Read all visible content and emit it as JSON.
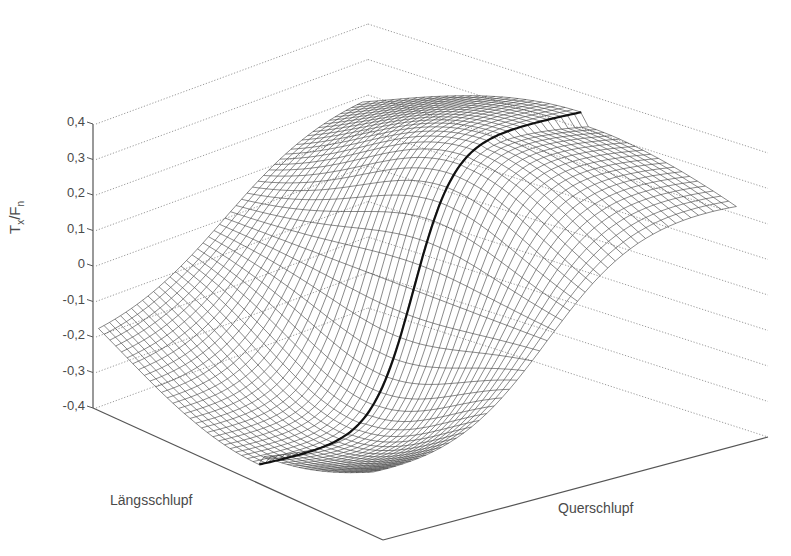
{
  "chart_data": {
    "type": "surface3d",
    "title": "",
    "zlabel": "T_x/F_n",
    "zlabel_main1": "T",
    "zlabel_sub1": "x",
    "zlabel_sep": "/F",
    "zlabel_sub2": "n",
    "xlabel": "Längsschlupf",
    "ylabel": "Querschlupf",
    "zlim": [
      -0.4,
      0.4
    ],
    "z_ticks": [
      0.4,
      0.3,
      0.2,
      0.1,
      0,
      -0.1,
      -0.2,
      -0.3,
      -0.4
    ],
    "z_tick_labels": [
      "0,4",
      "0,3",
      "0,2",
      "0,1",
      "0",
      "-0,1",
      "-0,2",
      "-0,3",
      "-0,4"
    ],
    "grid": "dotted back planes",
    "surface": {
      "description": "Wireframe mesh of longitudinal tyre force coefficient T_x/F_n vs. longitudinal slip (Längsschlupf) and lateral slip (Querschlupf); S-shaped saturation along Längsschlupf from about -0.3 to 0.38, magnitude decreasing with increasing |Querschlupf|",
      "grid_resolution": [
        48,
        48
      ],
      "peak_value": 0.38,
      "min_value": -0.38,
      "highlight_curve": "thick line at Querschlupf = 0"
    },
    "colors": {
      "mesh": "#3a3a3a",
      "highlight": "#111111",
      "axis": "#555555",
      "gridline": "#9a9a9a"
    }
  }
}
